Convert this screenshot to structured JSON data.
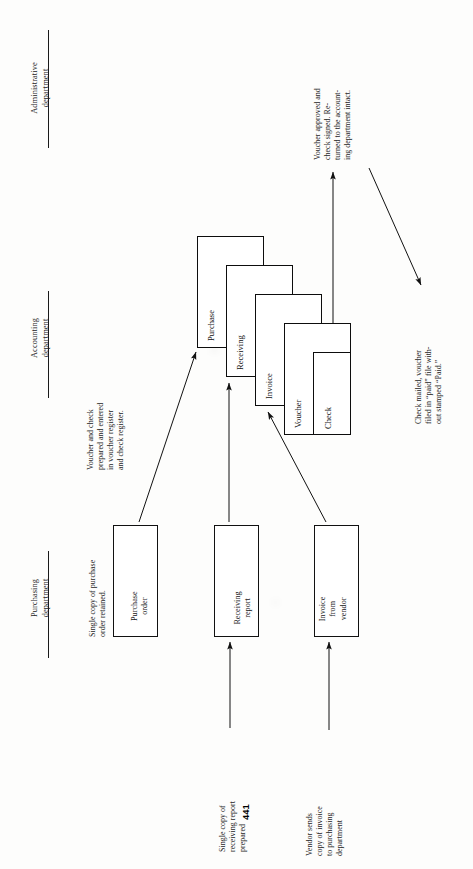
{
  "page": {
    "number": "441",
    "orientation": "rotated-90-ccw",
    "background_color": "#fdfdfc",
    "ink_color": "#111111"
  },
  "department_headers": [
    {
      "id": "administrative",
      "line1": "Administrative",
      "line2": "department"
    },
    {
      "id": "accounting",
      "line1": "Accounting",
      "line2": "department"
    },
    {
      "id": "purchasing",
      "line1": "Purchasing",
      "line2": "department"
    }
  ],
  "source_documents": [
    {
      "id": "purchase-order",
      "line1": "Purchase",
      "line2": "order",
      "note_lines": [
        "Single copy of purchase",
        "order retained."
      ]
    },
    {
      "id": "receiving-report",
      "line1": "Receiving",
      "line2": "report",
      "note_lines": [
        "Single copy of",
        "receiving report",
        "prepared"
      ]
    },
    {
      "id": "invoice-from-vendor",
      "line1": "Invoice",
      "line2": "from",
      "line3": "vendor",
      "note_lines": [
        "Vendor sends",
        "copy of invoice",
        "to purchasing",
        "department"
      ]
    }
  ],
  "document_stack": [
    {
      "id": "purchase",
      "label": "Purchase"
    },
    {
      "id": "receiving",
      "label": "Receiving"
    },
    {
      "id": "invoice",
      "label": "Invoice"
    },
    {
      "id": "voucher",
      "label": "Voucher"
    },
    {
      "id": "check",
      "label": "Check"
    }
  ],
  "annotations": [
    {
      "id": "voucher-prepared",
      "lines": [
        "Voucher and check",
        "prepared and entered",
        "in voucher register",
        "and check register."
      ]
    },
    {
      "id": "voucher-approved",
      "lines": [
        "Voucher approved and",
        "check signed. Re-",
        "turned to the account-",
        "ing department intact."
      ]
    },
    {
      "id": "check-mailed",
      "lines": [
        "Check mailed, voucher",
        "filed in “paid” file with-",
        "out stamped “Paid.”"
      ]
    }
  ]
}
